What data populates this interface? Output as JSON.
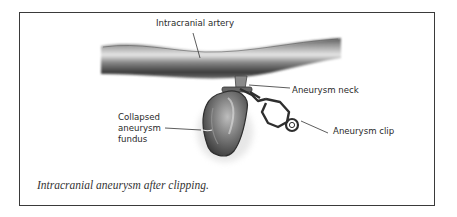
{
  "figure": {
    "type": "medical-illustration",
    "caption": "Intracranial aneurysm after clipping.",
    "labels": {
      "artery": "Intracranial artery",
      "neck": "Aneurysm neck",
      "fundus_line1": "Collapsed",
      "fundus_line2": "aneurysm",
      "fundus_line3": "fundus",
      "clip": "Aneurysm clip"
    },
    "colors": {
      "border": "#3a3a3a",
      "ink": "#2a2a2a",
      "vessel_dark": "#4a4a4a",
      "vessel_light": "#d8d8d8"
    }
  }
}
